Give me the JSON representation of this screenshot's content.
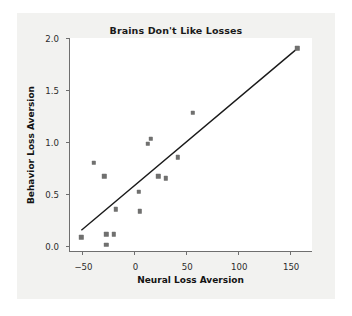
{
  "chart_data": {
    "type": "scatter",
    "title": "Brains Don't Like Losses",
    "xlabel": "Neural Loss Aversion",
    "ylabel": "Behavior Loss Aversion",
    "xlim": [
      -62,
      172
    ],
    "ylim": [
      -0.06,
      2.0
    ],
    "xticks": [
      -50,
      0,
      50,
      100,
      150
    ],
    "xticklabels": [
      "−50",
      "0",
      "50",
      "100",
      "150"
    ],
    "yticks": [
      0.0,
      0.5,
      1.0,
      1.5,
      2.0
    ],
    "yticklabels": [
      "0.0",
      "0.5",
      "1.0",
      "1.5",
      "2.0"
    ],
    "grid": false,
    "legend": null,
    "marker_color": "#70706f",
    "trendline_color": "#1a1a1a",
    "points": [
      {
        "x": -51,
        "y": 0.08
      },
      {
        "x": -39,
        "y": 0.8
      },
      {
        "x": -29,
        "y": 0.67
      },
      {
        "x": -27,
        "y": 0.11
      },
      {
        "x": -27,
        "y": 0.01
      },
      {
        "x": -20,
        "y": 0.11
      },
      {
        "x": -18,
        "y": 0.35
      },
      {
        "x": 4,
        "y": 0.52
      },
      {
        "x": 5,
        "y": 0.33
      },
      {
        "x": 13,
        "y": 0.98
      },
      {
        "x": 16,
        "y": 1.03
      },
      {
        "x": 23,
        "y": 0.67
      },
      {
        "x": 30,
        "y": 0.65
      },
      {
        "x": 42,
        "y": 0.85
      },
      {
        "x": 56,
        "y": 1.28
      },
      {
        "x": 157,
        "y": 1.9
      }
    ],
    "trendline": {
      "x1": -51,
      "y1": 0.14,
      "x2": 158,
      "y2": 1.9
    }
  }
}
